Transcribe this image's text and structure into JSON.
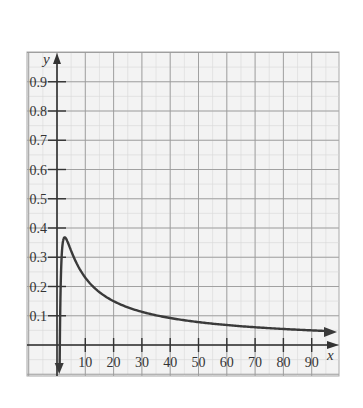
{
  "chart_data": {
    "type": "line",
    "title": "",
    "xlabel": "x",
    "ylabel": "y",
    "xlim": [
      -10,
      100
    ],
    "ylim": [
      -0.1,
      1.0
    ],
    "grid": true,
    "legend": null,
    "function": "y = ln(x)/x",
    "x_ticks": [
      10,
      20,
      30,
      40,
      50,
      60,
      70,
      80,
      90
    ],
    "x_tick_labels": [
      "10",
      "20",
      "30",
      "40",
      "50",
      "60",
      "70",
      "80",
      "90"
    ],
    "y_ticks": [
      0.1,
      0.2,
      0.3,
      0.4,
      0.5,
      0.6,
      0.7,
      0.8,
      0.9
    ],
    "y_tick_labels": [
      "0.1",
      "0.2",
      "0.3",
      "0.4",
      "0.5",
      "0.6",
      "0.7",
      "0.8",
      "0.9"
    ],
    "series": [
      {
        "name": "f(x)",
        "x": [
          1.05,
          1.5,
          2,
          2.718,
          3,
          4,
          5,
          7,
          10,
          15,
          20,
          30,
          40,
          50,
          60,
          70,
          80,
          90,
          97
        ],
        "values": [
          0.046,
          0.27,
          0.347,
          0.368,
          0.366,
          0.347,
          0.322,
          0.278,
          0.23,
          0.181,
          0.15,
          0.113,
          0.092,
          0.078,
          0.068,
          0.061,
          0.055,
          0.05,
          0.047
        ]
      }
    ],
    "annotations": [
      "arrow at right end of curve",
      "curve descends steeply toward -∞ near x=0 (arrow down)"
    ]
  },
  "colors": {
    "background": "#ffffff",
    "plot_bg": "#f3f3f3",
    "grid_major": "#9a9a9a",
    "grid_minor": "#d8d8d8",
    "axis": "#333333",
    "curve": "#3a3a3a"
  }
}
